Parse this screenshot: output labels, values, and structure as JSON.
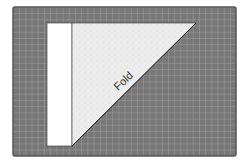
{
  "diagram": {
    "title": "",
    "mat": {
      "x": 13,
      "y": 7,
      "width": 223,
      "height": 149,
      "fill": "#777777",
      "border": "#555555",
      "grid_color": "#a8a8a8",
      "cell": 6.2
    },
    "paper": {
      "strip": {
        "x": 47,
        "y": 23,
        "width": 25,
        "height": 123,
        "fill": "#ffffff"
      },
      "triangle": {
        "points": "72,23 196,23 72,146",
        "fill": "#ececec"
      }
    },
    "fold_label": {
      "text": "Fold",
      "x": 128,
      "y": 84,
      "rotate": -43
    }
  }
}
